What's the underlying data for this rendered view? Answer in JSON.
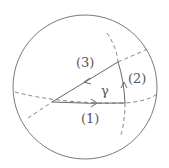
{
  "diagram": {
    "labels": {
      "path1": "(1)",
      "path2": "(2)",
      "path3": "(3)",
      "angle": "γ"
    },
    "colors": {
      "stroke": "#6a6a6a",
      "text": "#555555"
    }
  }
}
